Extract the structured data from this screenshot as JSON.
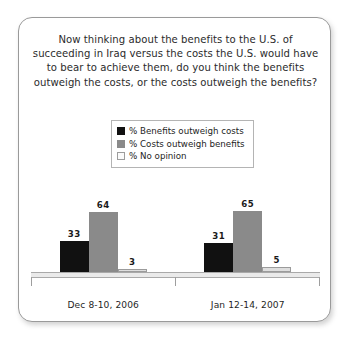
{
  "chart_data": {
    "type": "bar",
    "title": "Now thinking about the benefits to the U.S. of succeeding in Iraq versus the costs the U.S. would have to bear to achieve them, do you think the benefits outweigh the costs, or the costs outweigh the benefits?",
    "xlabel": "",
    "ylabel": "",
    "ylim": [
      0,
      100
    ],
    "grid": false,
    "legend_position": "top-center",
    "categories": [
      "Dec 8-10, 2006",
      "Jan 12-14, 2007"
    ],
    "series": [
      {
        "name": "% Benefits outweigh costs",
        "color": "#111111",
        "values": [
          33,
          31
        ]
      },
      {
        "name": "% Costs outweigh benefits",
        "color": "#8a8a8a",
        "values": [
          64,
          65
        ]
      },
      {
        "name": "% No opinion",
        "color": "#dedede",
        "values": [
          3,
          5
        ]
      }
    ]
  },
  "legend": {
    "items": [
      {
        "label": "% Benefits outweigh costs",
        "swatch": "legend-swatch-black"
      },
      {
        "label": "% Costs outweigh benefits",
        "swatch": "legend-swatch-gray"
      },
      {
        "label": "% No opinion",
        "swatch": "legend-swatch-light"
      }
    ]
  }
}
